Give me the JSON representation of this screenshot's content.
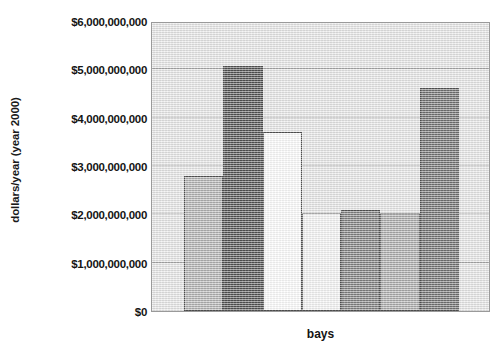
{
  "chart_data": {
    "type": "bar",
    "title": "",
    "xlabel": "bays",
    "ylabel": "dollars/year (year 2000)",
    "categories": [
      "",
      "",
      "",
      "",
      "",
      "",
      ""
    ],
    "values": [
      2800000000,
      5070000000,
      3700000000,
      2020000000,
      2080000000,
      2020000000,
      4620000000
    ],
    "ylim": [
      0,
      6000000000
    ],
    "ytick_values": [
      0,
      1000000000,
      2000000000,
      3000000000,
      4000000000,
      5000000000,
      6000000000
    ],
    "ytick_labels": [
      "$0",
      "$1,000,000,000",
      "$2,000,000,000",
      "$3,000,000,000",
      "$4,000,000,000",
      "$5,000,000,000",
      "$6,000,000,000"
    ],
    "grid": true,
    "legend": "none",
    "bar_colors": [
      "#a8a8a8",
      "#3a3a3a",
      "#ffffff",
      "#f4f4f4",
      "#6f6f6f",
      "#a0a0a0",
      "#5e5e5e"
    ],
    "bar_edge_color": "#3b3b3b",
    "plot_background": "#e4e4e4",
    "figure_background": "#ffffff"
  }
}
